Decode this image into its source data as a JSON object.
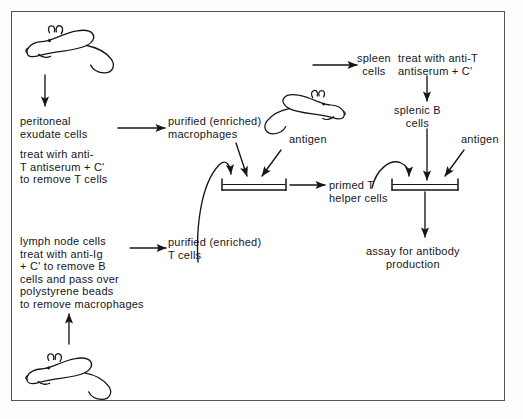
{
  "figure": {
    "type": "flow-diagram",
    "border_color": "#555555",
    "ink_color": "#16161a",
    "background": "#ffffff"
  },
  "animals": [
    {
      "id": "mouse-top-left",
      "name": "mouse-illustration",
      "facing": "left",
      "role": "source of peritoneal exudate cells"
    },
    {
      "id": "mouse-middle",
      "name": "mouse-illustration",
      "facing": "right",
      "role": "source of spleen cells"
    },
    {
      "id": "mouse-bottom-left",
      "name": "mouse-illustration",
      "facing": "left",
      "role": "source of lymph node cells"
    }
  ],
  "labels": {
    "peritoneal_exudate_cells": "peritoneal\nexudate cells",
    "treat_anti_t": "treat wirh anti-\nT antiserum + C'\nto remove T cells",
    "purified_macrophages": "purified (enriched)\nmacrophages",
    "lymph_node_block": "lymph node cells\ntreat with anti-Ig\n+ C' to remove B\ncells and pass over\npolystyrene beads\nto remove macrophages",
    "purified_t_cells": "purified (enriched)\nT cells",
    "antigen_left": "antigen",
    "antigen_right": "antigen",
    "primed_t_helper_cells": "primed T\nhelper cells",
    "spleen_cells": "spleen\ncells",
    "treat_anti_t_right": "treat with anti-T\nantiserum + C'",
    "splenic_b_cells": "splenic B\ncells",
    "assay": "assay for antibody\nproduction"
  },
  "vessels": [
    {
      "id": "culture-dish-left",
      "name": "culture-dish",
      "inputs": [
        "purified (enriched) macrophages",
        "antigen",
        "purified (enriched) T cells"
      ],
      "output": "primed T helper cells"
    },
    {
      "id": "culture-dish-right",
      "name": "culture-dish",
      "inputs": [
        "primed T helper cells",
        "splenic B cells",
        "antigen"
      ],
      "output": "assay for antibody production"
    }
  ],
  "arrows": [
    {
      "from": "mouse-top-left",
      "to": "peritoneal exudate cells",
      "style": "straight-down"
    },
    {
      "from": "peritoneal exudate cells",
      "to": "purified (enriched) macrophages",
      "style": "straight-right"
    },
    {
      "from": "purified (enriched) macrophages",
      "to": "culture-dish-left",
      "style": "diagonal-down"
    },
    {
      "from": "antigen (left)",
      "to": "culture-dish-left",
      "style": "diagonal-down-left"
    },
    {
      "from": "purified (enriched) T cells",
      "to": "culture-dish-left",
      "style": "curved-up"
    },
    {
      "from": "mouse-bottom-left",
      "to": "lymph node cells block",
      "style": "straight-up"
    },
    {
      "from": "lymph node cells block",
      "to": "purified (enriched) T cells",
      "style": "straight-right"
    },
    {
      "from": "culture-dish-left",
      "to": "primed T helper cells",
      "style": "straight-right"
    },
    {
      "from": "mouse-middle",
      "to": "spleen cells",
      "style": "straight-right"
    },
    {
      "from": "treat with anti-T antiserum + C'",
      "to": "splenic B cells",
      "style": "straight-down"
    },
    {
      "from": "splenic B cells",
      "to": "culture-dish-right",
      "style": "straight-down"
    },
    {
      "from": "primed T helper cells",
      "to": "culture-dish-right",
      "style": "curved-up-over"
    },
    {
      "from": "antigen (right)",
      "to": "culture-dish-right",
      "style": "diagonal-down-left"
    },
    {
      "from": "culture-dish-right",
      "to": "assay for antibody production",
      "style": "straight-down"
    }
  ]
}
